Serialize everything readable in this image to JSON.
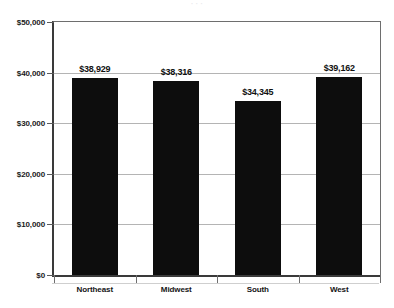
{
  "chart_data": {
    "type": "bar",
    "title": "",
    "xlabel": "",
    "ylabel": "",
    "categories": [
      "Northeast",
      "Midwest",
      "South",
      "West"
    ],
    "values": [
      38929,
      38316,
      34345,
      39162
    ],
    "value_labels": [
      "$38,929",
      "$38,316",
      "$34,345",
      "$39,162"
    ],
    "ylim": [
      0,
      50000
    ],
    "ytick_values": [
      50000,
      40000,
      30000,
      20000,
      10000,
      0
    ],
    "ytick_labels": [
      "$50,000",
      "$40,000",
      "$30,000",
      "$20,000",
      "$10,000",
      "$0"
    ],
    "grid": true,
    "grid_axis": "y",
    "legend": false,
    "bar_color": "#0d0d0d",
    "background_color": "#ffffff",
    "axis_color": "#3a3a3a",
    "gridline_color": "#b4b4b4"
  },
  "title_remnant": "· · ·"
}
